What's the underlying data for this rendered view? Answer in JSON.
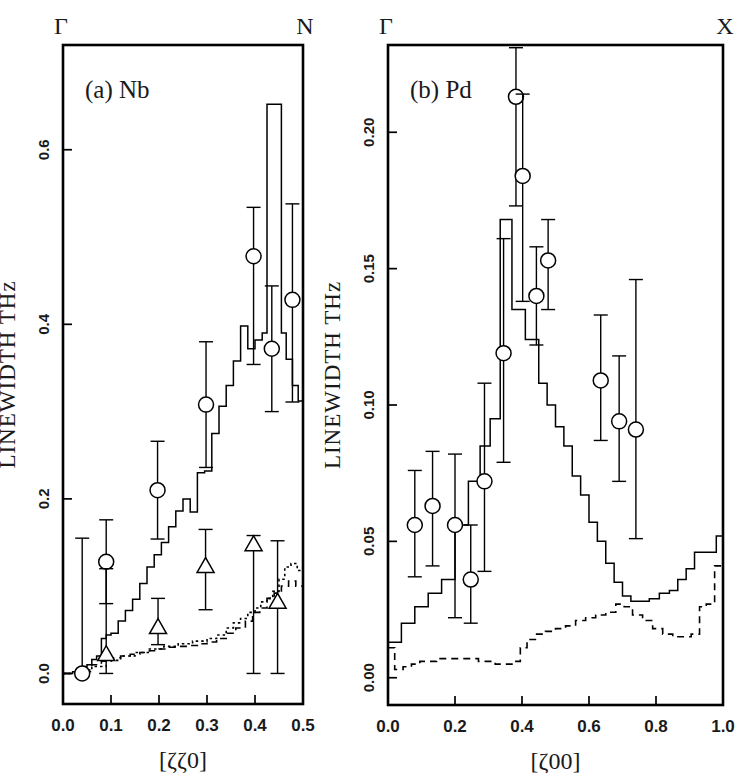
{
  "figure": {
    "background": "#ffffff",
    "foreground": "#000000",
    "width": 747,
    "height": 773
  },
  "chart_data": [
    {
      "type": "line",
      "panel_id": "a",
      "panel_label": "(a)  Nb",
      "title": "",
      "xlabel": "[ζζ0]",
      "ylabel": "LINEWIDTH  THz",
      "xlim": [
        0.0,
        0.5
      ],
      "ylim": [
        -0.035,
        0.72
      ],
      "grid": false,
      "legend": "none",
      "xticks": [
        0.0,
        0.1,
        0.2,
        0.3,
        0.4,
        0.5
      ],
      "xticklabels": [
        "0.0",
        "0.1",
        "0.2",
        "0.3",
        "0.4",
        "0.5"
      ],
      "yticks": [
        0.0,
        0.2,
        0.4,
        0.6
      ],
      "yticklabels": [
        "0.0",
        "0.2",
        "0.4",
        "0.6"
      ],
      "brillouin_start_label": "Γ",
      "brillouin_end_label": "N",
      "series": [
        {
          "name": "calculated-upper-branch",
          "style": "solid-step",
          "x": [
            0.0,
            0.01,
            0.02,
            0.03,
            0.04,
            0.05,
            0.06,
            0.07,
            0.08,
            0.09,
            0.1,
            0.115,
            0.13,
            0.145,
            0.16,
            0.175,
            0.19,
            0.205,
            0.22,
            0.235,
            0.25,
            0.265,
            0.28,
            0.295,
            0.31,
            0.325,
            0.34,
            0.355,
            0.37,
            0.385,
            0.4,
            0.415,
            0.425,
            0.435,
            0.445,
            0.455,
            0.465,
            0.478,
            0.49,
            0.5
          ],
          "y": [
            0.0,
            0.0,
            0.002,
            0.004,
            0.008,
            0.01,
            0.016,
            0.02,
            0.04,
            0.044,
            0.046,
            0.06,
            0.072,
            0.085,
            0.103,
            0.122,
            0.136,
            0.15,
            0.168,
            0.186,
            0.2,
            0.185,
            0.23,
            0.232,
            0.275,
            0.306,
            0.33,
            0.358,
            0.398,
            0.372,
            0.382,
            0.39,
            0.652,
            0.652,
            0.652,
            0.39,
            0.36,
            0.33,
            0.312,
            0.312
          ]
        },
        {
          "name": "calculated-lower-branch-dashed",
          "style": "dashed-step",
          "x": [
            0.0,
            0.02,
            0.04,
            0.06,
            0.08,
            0.1,
            0.12,
            0.14,
            0.16,
            0.18,
            0.2,
            0.22,
            0.24,
            0.26,
            0.28,
            0.3,
            0.32,
            0.34,
            0.36,
            0.38,
            0.395,
            0.41,
            0.425,
            0.44,
            0.455,
            0.47,
            0.485,
            0.5
          ],
          "y": [
            0.0,
            0.001,
            0.004,
            0.01,
            0.014,
            0.018,
            0.02,
            0.022,
            0.024,
            0.026,
            0.028,
            0.03,
            0.031,
            0.032,
            0.034,
            0.036,
            0.04,
            0.046,
            0.052,
            0.06,
            0.07,
            0.075,
            0.086,
            0.092,
            0.1,
            0.106,
            0.1,
            0.1
          ]
        },
        {
          "name": "calculated-lower-branch-dotted",
          "style": "dotted-step",
          "x": [
            0.0,
            0.03,
            0.06,
            0.09,
            0.12,
            0.15,
            0.18,
            0.21,
            0.24,
            0.27,
            0.3,
            0.32,
            0.34,
            0.355,
            0.37,
            0.385,
            0.4,
            0.412,
            0.425,
            0.437,
            0.45,
            0.462,
            0.475,
            0.488,
            0.5
          ],
          "y": [
            0.0,
            0.002,
            0.008,
            0.015,
            0.02,
            0.024,
            0.028,
            0.031,
            0.034,
            0.037,
            0.04,
            0.044,
            0.052,
            0.058,
            0.063,
            0.07,
            0.075,
            0.082,
            0.086,
            0.094,
            0.108,
            0.122,
            0.126,
            0.118,
            0.118
          ]
        }
      ],
      "points": [
        {
          "marker": "circle",
          "x": 0.04,
          "y": 0.0,
          "yerr_low": 0.0,
          "yerr_high": 0.155
        },
        {
          "marker": "circle",
          "x": 0.09,
          "y": 0.128,
          "yerr_low": 0.048,
          "yerr_high": 0.048
        },
        {
          "marker": "circle",
          "x": 0.197,
          "y": 0.21,
          "yerr_low": 0.056,
          "yerr_high": 0.056
        },
        {
          "marker": "circle",
          "x": 0.298,
          "y": 0.308,
          "yerr_low": 0.072,
          "yerr_high": 0.072
        },
        {
          "marker": "circle",
          "x": 0.397,
          "y": 0.478,
          "yerr_low": 0.124,
          "yerr_high": 0.056
        },
        {
          "marker": "circle",
          "x": 0.435,
          "y": 0.372,
          "yerr_low": 0.072,
          "yerr_high": 0.072
        },
        {
          "marker": "circle",
          "x": 0.478,
          "y": 0.428,
          "yerr_low": 0.117,
          "yerr_high": 0.11
        },
        {
          "marker": "triangle",
          "x": 0.09,
          "y": 0.022,
          "yerr_low": 0.022,
          "yerr_high": 0.098
        },
        {
          "marker": "triangle",
          "x": 0.198,
          "y": 0.053,
          "yerr_low": 0.02,
          "yerr_high": 0.033
        },
        {
          "marker": "triangle",
          "x": 0.297,
          "y": 0.123,
          "yerr_low": 0.05,
          "yerr_high": 0.042
        },
        {
          "marker": "triangle",
          "x": 0.397,
          "y": 0.148,
          "yerr_low": 0.148,
          "yerr_high": 0.01
        },
        {
          "marker": "triangle",
          "x": 0.447,
          "y": 0.082,
          "yerr_low": 0.082,
          "yerr_high": 0.07
        }
      ]
    },
    {
      "type": "line",
      "panel_id": "b",
      "panel_label": "(b)  Pd",
      "title": "",
      "xlabel": "[ζ00]",
      "ylabel": "LINEWIDTH  THz",
      "xlim": [
        0.0,
        1.0
      ],
      "ylim": [
        -0.01,
        0.232
      ],
      "grid": false,
      "legend": "none",
      "xticks": [
        0.0,
        0.2,
        0.4,
        0.6,
        0.8,
        1.0
      ],
      "xticklabels": [
        "0.0",
        "0.2",
        "0.4",
        "0.6",
        "0.8",
        "1.0"
      ],
      "yticks": [
        0.0,
        0.05,
        0.1,
        0.15,
        0.2
      ],
      "yticklabels": [
        "0.00",
        "0.05",
        "0.10",
        "0.15",
        "0.20"
      ],
      "brillouin_start_label": "Γ",
      "brillouin_end_label": "X",
      "series": [
        {
          "name": "calculated-longitudinal-solid",
          "style": "solid-step",
          "x": [
            0.0,
            0.02,
            0.04,
            0.06,
            0.08,
            0.1,
            0.12,
            0.14,
            0.16,
            0.18,
            0.2,
            0.22,
            0.24,
            0.26,
            0.275,
            0.29,
            0.305,
            0.32,
            0.335,
            0.35,
            0.37,
            0.39,
            0.41,
            0.43,
            0.45,
            0.475,
            0.5,
            0.525,
            0.55,
            0.575,
            0.6,
            0.625,
            0.65,
            0.675,
            0.7,
            0.725,
            0.75,
            0.78,
            0.81,
            0.84,
            0.865,
            0.89,
            0.915,
            0.94,
            0.96,
            0.98,
            1.0
          ],
          "y": [
            0.013,
            0.013,
            0.02,
            0.02,
            0.026,
            0.026,
            0.031,
            0.031,
            0.036,
            0.036,
            0.056,
            0.056,
            0.072,
            0.072,
            0.085,
            0.085,
            0.095,
            0.095,
            0.168,
            0.168,
            0.135,
            0.135,
            0.124,
            0.124,
            0.108,
            0.1,
            0.092,
            0.085,
            0.074,
            0.067,
            0.057,
            0.05,
            0.042,
            0.035,
            0.03,
            0.028,
            0.028,
            0.029,
            0.031,
            0.032,
            0.036,
            0.04,
            0.046,
            0.046,
            0.046,
            0.052,
            0.052
          ]
        },
        {
          "name": "calculated-transverse-dashed",
          "style": "dashed-step",
          "x": [
            0.0,
            0.02,
            0.045,
            0.07,
            0.095,
            0.12,
            0.145,
            0.17,
            0.195,
            0.22,
            0.245,
            0.27,
            0.295,
            0.32,
            0.345,
            0.37,
            0.395,
            0.415,
            0.44,
            0.47,
            0.5,
            0.53,
            0.56,
            0.59,
            0.62,
            0.65,
            0.68,
            0.705,
            0.73,
            0.76,
            0.79,
            0.82,
            0.85,
            0.88,
            0.905,
            0.93,
            0.95,
            0.975,
            1.0
          ],
          "y": [
            0.011,
            0.003,
            0.004,
            0.005,
            0.006,
            0.006,
            0.007,
            0.007,
            0.007,
            0.007,
            0.007,
            0.006,
            0.006,
            0.005,
            0.005,
            0.006,
            0.011,
            0.014,
            0.016,
            0.017,
            0.018,
            0.019,
            0.021,
            0.022,
            0.023,
            0.024,
            0.027,
            0.026,
            0.023,
            0.021,
            0.018,
            0.016,
            0.015,
            0.015,
            0.016,
            0.026,
            0.027,
            0.041,
            0.041
          ]
        }
      ],
      "points": [
        {
          "marker": "circle",
          "x": 0.08,
          "y": 0.056,
          "yerr_low": 0.019,
          "yerr_high": 0.02
        },
        {
          "marker": "circle",
          "x": 0.133,
          "y": 0.063,
          "yerr_low": 0.022,
          "yerr_high": 0.02
        },
        {
          "marker": "circle",
          "x": 0.2,
          "y": 0.056,
          "yerr_low": 0.034,
          "yerr_high": 0.026
        },
        {
          "marker": "circle",
          "x": 0.247,
          "y": 0.036,
          "yerr_low": 0.016,
          "yerr_high": 0.02
        },
        {
          "marker": "circle",
          "x": 0.288,
          "y": 0.072,
          "yerr_low": 0.033,
          "yerr_high": 0.036
        },
        {
          "marker": "circle",
          "x": 0.345,
          "y": 0.119,
          "yerr_low": 0.04,
          "yerr_high": 0.042
        },
        {
          "marker": "circle",
          "x": 0.382,
          "y": 0.213,
          "yerr_low": 0.04,
          "yerr_high": 0.018
        },
        {
          "marker": "circle",
          "x": 0.402,
          "y": 0.184,
          "yerr_low": 0.046,
          "yerr_high": 0.03
        },
        {
          "marker": "circle",
          "x": 0.443,
          "y": 0.14,
          "yerr_low": 0.018,
          "yerr_high": 0.018
        },
        {
          "marker": "circle",
          "x": 0.478,
          "y": 0.153,
          "yerr_low": 0.018,
          "yerr_high": 0.015
        },
        {
          "marker": "circle",
          "x": 0.635,
          "y": 0.109,
          "yerr_low": 0.022,
          "yerr_high": 0.024
        },
        {
          "marker": "circle",
          "x": 0.69,
          "y": 0.094,
          "yerr_low": 0.022,
          "yerr_high": 0.024
        },
        {
          "marker": "circle",
          "x": 0.74,
          "y": 0.091,
          "yerr_low": 0.04,
          "yerr_high": 0.055
        }
      ]
    }
  ]
}
